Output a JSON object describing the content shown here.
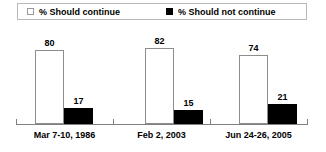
{
  "legend": {
    "entries": [
      {
        "label": "% Should continue",
        "swatch": "white-square-icon",
        "color": "#ffffff"
      },
      {
        "label": "% Should not continue",
        "swatch": "black-square-icon",
        "color": "#000000"
      }
    ]
  },
  "chart_data": {
    "type": "bar",
    "title": "",
    "xlabel": "",
    "ylabel": "",
    "ylim": [
      0,
      100
    ],
    "grid": false,
    "legend_position": "top",
    "categories": [
      "Mar 7-10, 1986",
      "Feb 2, 2003",
      "Jun 24-26, 2005"
    ],
    "series": [
      {
        "name": "% Should continue",
        "color": "#ffffff",
        "values": [
          80,
          82,
          74
        ]
      },
      {
        "name": "% Should not continue",
        "color": "#000000",
        "values": [
          17,
          15,
          21
        ]
      }
    ],
    "value_labels": {
      "group0": {
        "white": "80",
        "black": "17"
      },
      "group1": {
        "white": "82",
        "black": "15"
      },
      "group2": {
        "white": "74",
        "black": "21"
      }
    }
  }
}
